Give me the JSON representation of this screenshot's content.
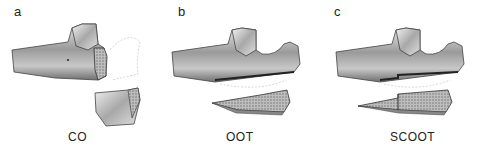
{
  "panels": [
    {
      "letter": "a",
      "label": "CO"
    },
    {
      "letter": "b",
      "label": "OOT"
    },
    {
      "letter": "c",
      "label": "SCOOT"
    }
  ]
}
